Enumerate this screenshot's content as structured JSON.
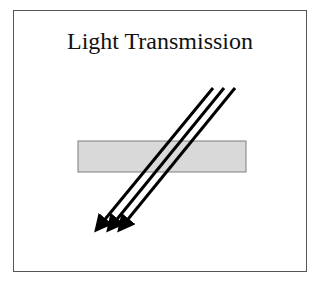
{
  "title": "Light Transmission",
  "diagram": {
    "slab": {
      "x": 78,
      "y": 141,
      "width": 168,
      "height": 31,
      "fill": "#d9d9d9",
      "stroke": "#7f7f7f"
    },
    "rays": [
      {
        "x1": 213,
        "y1": 88,
        "x2": 97,
        "y2": 229
      },
      {
        "x1": 224,
        "y1": 88,
        "x2": 109,
        "y2": 229
      },
      {
        "x1": 235,
        "y1": 88,
        "x2": 120,
        "y2": 229
      }
    ],
    "ray_color": "#000000"
  }
}
